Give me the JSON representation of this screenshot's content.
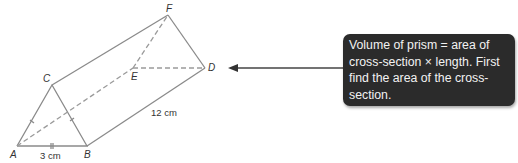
{
  "diagram": {
    "type": "triangular-prism",
    "vertices": {
      "A": "A",
      "B": "B",
      "C": "C",
      "D": "D",
      "E": "E",
      "F": "F"
    },
    "dimensions": {
      "base": "3 cm",
      "length": "12 cm"
    },
    "line_color": "#8a8a8a"
  },
  "callout": {
    "text": "Volume of prism = area of cross-section × length. First find the area of the cross-section.",
    "background": "#2b2b2b",
    "text_color": "#f2f2f2"
  }
}
